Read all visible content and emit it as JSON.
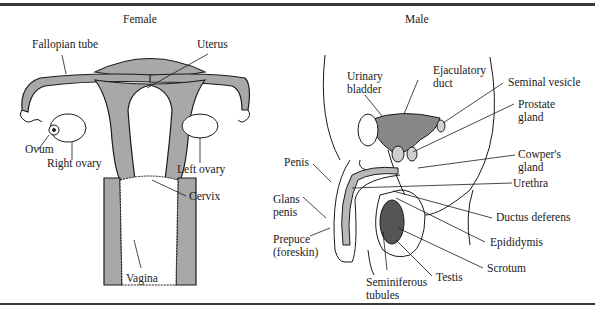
{
  "titles": {
    "female": "Female",
    "male": "Male"
  },
  "female_labels": {
    "fallopian_tube": "Fallopian tube",
    "uterus": "Uterus",
    "ovum": "Ovum",
    "right_ovary": "Right ovary",
    "left_ovary": "Left ovary",
    "cervix": "Cervix",
    "vagina": "Vagina"
  },
  "male_labels": {
    "urinary_bladder": "Urinary\nbladder",
    "ejaculatory_duct": "Ejaculatory\nduct",
    "seminal_vesicle": "Seminal vesicle",
    "prostate_gland": "Prostate\ngland",
    "cowpers_gland": "Cowper's\ngland",
    "penis": "Penis",
    "urethra": "Urethra",
    "glans_penis": "Glans\npenis",
    "ductus_deferens": "Ductus deferens",
    "epididymis": "Epididymis",
    "prepuce": "Prepuce\n(foreskin)",
    "scrotum": "Scrotum",
    "testis": "Testis",
    "seminiferous_tubules": "Seminiferous\ntubules"
  },
  "colors": {
    "tissue_fill": "#a8a8a8",
    "line": "#1a1a1a",
    "rule": "#3a3a3a"
  }
}
